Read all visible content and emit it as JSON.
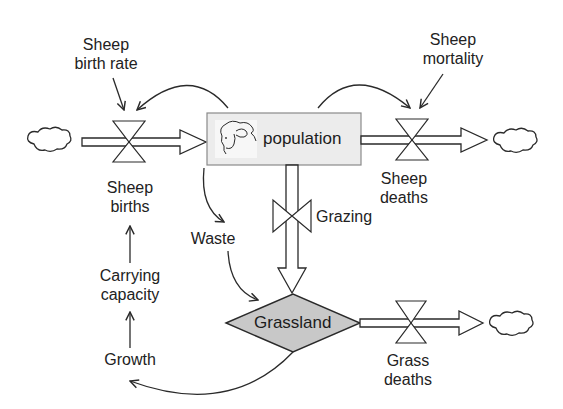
{
  "diagram": {
    "type": "stock-and-flow",
    "colors": {
      "stroke": "#2a2a2a",
      "stock_population_fill": "#ececec",
      "stock_grassland_fill": "#c8c8c8",
      "background": "#ffffff"
    },
    "stocks": {
      "population": {
        "label": "population",
        "icon": "sheep-icon"
      },
      "grassland": {
        "label": "Grassland"
      }
    },
    "flows": {
      "sheep_births": {
        "label": "Sheep\nbirths"
      },
      "sheep_deaths": {
        "label": "Sheep\ndeaths"
      },
      "grazing": {
        "label": "Grazing"
      },
      "grass_deaths": {
        "label": "Grass\ndeaths"
      }
    },
    "variables": {
      "sheep_birth_rate": {
        "label": "Sheep\nbirth rate"
      },
      "sheep_mortality": {
        "label": "Sheep\nmortality"
      },
      "waste": {
        "label": "Waste"
      },
      "carrying_capacity": {
        "label": "Carrying\ncapacity"
      },
      "growth": {
        "label": "Growth"
      }
    },
    "sources_sinks": [
      "cloud-source-births",
      "cloud-sink-sheep-deaths",
      "cloud-sink-grass-deaths"
    ]
  }
}
